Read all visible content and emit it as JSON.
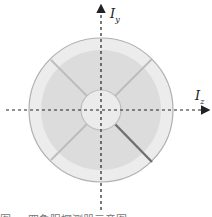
{
  "diagram": {
    "axis_y_label": "I",
    "axis_y_sub": "y",
    "axis_z_label": "I",
    "axis_z_sub": "z",
    "colors": {
      "outer_ring": "#ececec",
      "middle_ring": "#dcdcdc",
      "inner_disc": "#ebebeb",
      "outline": "#b0b0b0",
      "highlight_divider": "#707070",
      "axis": "#222222"
    },
    "caption": "图 ... 四象限探测器示意图"
  }
}
